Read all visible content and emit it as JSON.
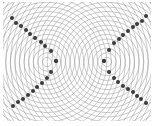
{
  "diagram": {
    "type": "two-source wave interference pattern",
    "width": 154,
    "height": 126,
    "background": "#ffffff",
    "ring_color": "#9a9a9a",
    "dot_color": "#3a3a3a",
    "clip": {
      "x": 3,
      "y": 2,
      "width": 148,
      "height": 119
    },
    "sources": [
      {
        "name": "left-source",
        "cx": 47,
        "cy": 62
      },
      {
        "name": "right-source",
        "cx": 107,
        "cy": 62
      }
    ],
    "ring_spacing": 4.6,
    "ring_count": 26,
    "nodal_lines": [
      {
        "name": "left-upper",
        "points": [
          [
            12,
            18
          ],
          [
            16,
            23
          ],
          [
            21,
            26
          ],
          [
            26,
            30
          ],
          [
            30,
            34
          ],
          [
            35,
            38
          ],
          [
            41,
            42
          ],
          [
            45,
            46
          ],
          [
            51,
            51
          ],
          [
            56,
            61
          ]
        ]
      },
      {
        "name": "left-lower",
        "points": [
          [
            56,
            61
          ],
          [
            51,
            72
          ],
          [
            47,
            78
          ],
          [
            42,
            83
          ],
          [
            37,
            87
          ],
          [
            33,
            91
          ],
          [
            28,
            95
          ],
          [
            23,
            99
          ],
          [
            18,
            102
          ],
          [
            13,
            106
          ]
        ]
      },
      {
        "name": "right-upper",
        "points": [
          [
            146,
            16
          ],
          [
            142,
            21
          ],
          [
            137,
            24
          ],
          [
            133,
            27
          ],
          [
            128,
            31
          ],
          [
            123,
            35
          ],
          [
            119,
            39
          ],
          [
            114,
            43
          ],
          [
            109,
            50
          ],
          [
            104,
            61
          ]
        ]
      },
      {
        "name": "right-lower",
        "points": [
          [
            104,
            61
          ],
          [
            109,
            72
          ],
          [
            114,
            78
          ],
          [
            118,
            82
          ],
          [
            123,
            86
          ],
          [
            128,
            89
          ],
          [
            133,
            92
          ],
          [
            137,
            96
          ],
          [
            141,
            99
          ],
          [
            146,
            103
          ]
        ]
      }
    ],
    "dot_radius": 2
  }
}
